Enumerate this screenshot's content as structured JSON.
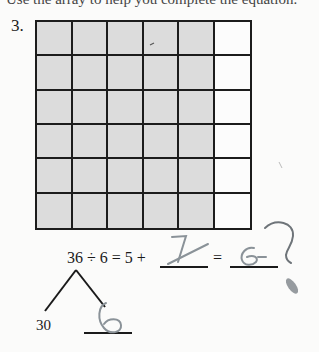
{
  "header": {
    "cutoff_instruction": "Use the array to help you complete the equation."
  },
  "problem": {
    "number": "3.",
    "array": {
      "rows": 6,
      "columns": 6,
      "shaded_columns": 5,
      "unshaded_columns": 1,
      "shaded_color": "#dcdcdc",
      "line_color": "#1c1c1c"
    },
    "equation": {
      "text": "36 ÷ 6 = 5 +",
      "equals": "=",
      "blank_1_handwritten": "1",
      "blank_2_handwritten": "6"
    },
    "number_bond": {
      "left_part": "30",
      "right_part_handwritten": "6"
    }
  },
  "annotations": {
    "handwriting_color": "#8a9298",
    "margin_mark": "?"
  }
}
